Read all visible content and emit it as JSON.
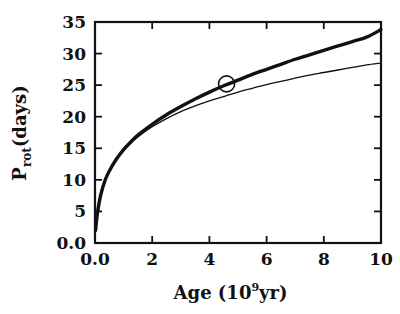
{
  "chart_data": {
    "type": "line",
    "title": "",
    "xlabel": "Age (10⁹ yr)",
    "xlabel_base": "Age (10",
    "xlabel_exp": "9",
    "xlabel_tail": " yr)",
    "ylabel": "P_rot (days)",
    "ylabel_base": "P",
    "ylabel_sub": "rot",
    "ylabel_tail": " (days)",
    "xlim": [
      0,
      10
    ],
    "ylim": [
      0,
      35
    ],
    "grid": false,
    "legend": "none",
    "xticks": [
      0,
      2,
      4,
      6,
      8,
      10
    ],
    "xtick_labels": [
      "0.0",
      "2",
      "4",
      "6",
      "8",
      "10"
    ],
    "yticks": [
      0,
      5,
      10,
      15,
      20,
      25,
      30,
      35
    ],
    "ytick_labels": [
      "0.0",
      "5",
      "10",
      "15",
      "20",
      "25",
      "30",
      "35"
    ],
    "series": [
      {
        "name": "thick-model",
        "style": "thick",
        "x": [
          0.02,
          0.05,
          0.1,
          0.2,
          0.35,
          0.5,
          0.75,
          1.0,
          1.25,
          1.5,
          2.0,
          2.5,
          3.0,
          3.5,
          4.0,
          4.5,
          5.0,
          5.5,
          6.0,
          6.5,
          7.0,
          7.5,
          8.0,
          8.5,
          9.0,
          9.5,
          10.0
        ],
        "y": [
          2.0,
          3.4,
          5.2,
          7.6,
          9.9,
          11.4,
          13.3,
          14.8,
          16.0,
          17.1,
          18.8,
          20.3,
          21.6,
          22.8,
          23.9,
          24.9,
          25.8,
          26.7,
          27.5,
          28.3,
          29.1,
          29.8,
          30.5,
          31.2,
          31.9,
          32.6,
          33.8
        ]
      },
      {
        "name": "thin-model",
        "style": "thin",
        "x": [
          0.02,
          0.05,
          0.1,
          0.2,
          0.35,
          0.5,
          0.75,
          1.0,
          1.25,
          1.5,
          2.0,
          2.5,
          3.0,
          3.5,
          4.0,
          4.5,
          5.0,
          5.5,
          6.0,
          6.5,
          7.0,
          7.5,
          8.0,
          8.5,
          9.0,
          9.5,
          10.0
        ],
        "y": [
          2.0,
          3.6,
          5.6,
          8.0,
          10.1,
          11.5,
          13.3,
          14.7,
          15.8,
          16.8,
          18.4,
          19.7,
          20.8,
          21.7,
          22.5,
          23.2,
          23.9,
          24.5,
          25.1,
          25.6,
          26.1,
          26.6,
          27.0,
          27.4,
          27.8,
          28.2,
          28.5
        ]
      }
    ],
    "annotations": [
      {
        "name": "solar-symbol",
        "symbol": "circle",
        "x": 4.6,
        "y": 25.2,
        "radius_px": 8
      }
    ],
    "colors": {
      "ink": "#111111",
      "background": "#ffffff"
    }
  },
  "figure": {
    "plot_area": {
      "left": 95,
      "top": 22,
      "right": 381,
      "bottom": 243
    }
  }
}
